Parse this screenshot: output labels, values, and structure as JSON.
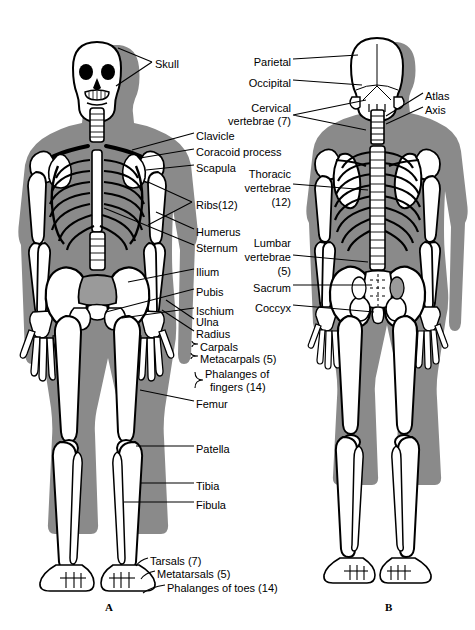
{
  "figure": {
    "background_color": "#ffffff",
    "body_silhouette_color": "#8a8a8a",
    "bone_color": "#ffffff",
    "outline_color": "#000000"
  },
  "panels": [
    {
      "id": "A",
      "label": "A",
      "view": "anterior",
      "x": 105,
      "y": 607
    },
    {
      "id": "B",
      "label": "B",
      "view": "posterior",
      "x": 385,
      "y": 607
    }
  ],
  "labels_left": [
    {
      "name": "skull",
      "text": "Skull",
      "x": 155,
      "y": 64
    },
    {
      "name": "clavicle",
      "text": "Clavicle",
      "x": 196,
      "y": 136
    },
    {
      "name": "coracoid-process",
      "text": "Coracoid process",
      "x": 196,
      "y": 152
    },
    {
      "name": "scapula",
      "text": "Scapula",
      "x": 196,
      "y": 168
    },
    {
      "name": "ribs",
      "text": "Ribs(12)",
      "x": 196,
      "y": 205
    },
    {
      "name": "humerus",
      "text": "Humerus",
      "x": 196,
      "y": 232
    },
    {
      "name": "sternum",
      "text": "Sternum",
      "x": 196,
      "y": 248
    },
    {
      "name": "ilium",
      "text": "Ilium",
      "x": 196,
      "y": 272
    },
    {
      "name": "pubis",
      "text": "Pubis",
      "x": 196,
      "y": 292
    },
    {
      "name": "ischium",
      "text": "Ischium",
      "x": 196,
      "y": 311
    },
    {
      "name": "ulna",
      "text": "Ulna",
      "x": 196,
      "y": 322
    },
    {
      "name": "radius",
      "text": "Radius",
      "x": 196,
      "y": 334
    },
    {
      "name": "carpals",
      "text": "Carpals",
      "x": 200,
      "y": 347
    },
    {
      "name": "metacarpals",
      "text": "Metacarpals (5)",
      "x": 200,
      "y": 359
    },
    {
      "name": "phalanges-fingers-1",
      "text": "Phalanges of",
      "x": 205,
      "y": 374
    },
    {
      "name": "phalanges-fingers-2",
      "text": "fingers (14)",
      "x": 210,
      "y": 387
    },
    {
      "name": "femur",
      "text": "Femur",
      "x": 196,
      "y": 404
    },
    {
      "name": "patella",
      "text": "Patella",
      "x": 196,
      "y": 449
    },
    {
      "name": "tibia",
      "text": "Tibia",
      "x": 196,
      "y": 486
    },
    {
      "name": "fibula",
      "text": "Fibula",
      "x": 196,
      "y": 505
    },
    {
      "name": "tarsals",
      "text": "Tarsals (7)",
      "x": 150,
      "y": 561
    },
    {
      "name": "metatarsals",
      "text": "Metatarsals (5)",
      "x": 157,
      "y": 574
    },
    {
      "name": "phalanges-toes",
      "text": "Phalanges of toes (14)",
      "x": 167,
      "y": 588
    }
  ],
  "labels_right": [
    {
      "name": "parietal",
      "text": "Parietal",
      "x": 291,
      "y": 62,
      "align": "right"
    },
    {
      "name": "occipital",
      "text": "Occipital",
      "x": 291,
      "y": 83,
      "align": "right"
    },
    {
      "name": "cervical-vertebrae-1",
      "text": "Cervical",
      "x": 291,
      "y": 108,
      "align": "right"
    },
    {
      "name": "cervical-vertebrae-2",
      "text": "vertebrae (7)",
      "x": 291,
      "y": 121,
      "align": "right"
    },
    {
      "name": "atlas",
      "text": "Atlas",
      "x": 425,
      "y": 96,
      "align": "left"
    },
    {
      "name": "axis",
      "text": "Axis",
      "x": 425,
      "y": 110,
      "align": "left"
    },
    {
      "name": "thoracic-vertebrae-1",
      "text": "Thoracic",
      "x": 291,
      "y": 174,
      "align": "right"
    },
    {
      "name": "thoracic-vertebrae-2",
      "text": "vertebrae",
      "x": 291,
      "y": 188,
      "align": "right"
    },
    {
      "name": "thoracic-vertebrae-3",
      "text": "(12)",
      "x": 291,
      "y": 202,
      "align": "right"
    },
    {
      "name": "lumbar-vertebrae-1",
      "text": "Lumbar",
      "x": 291,
      "y": 243,
      "align": "right"
    },
    {
      "name": "lumbar-vertebrae-2",
      "text": "vertebrae",
      "x": 291,
      "y": 257,
      "align": "right"
    },
    {
      "name": "lumbar-vertebrae-3",
      "text": "(5)",
      "x": 291,
      "y": 271,
      "align": "right"
    },
    {
      "name": "sacrum",
      "text": "Sacrum",
      "x": 291,
      "y": 288,
      "align": "right"
    },
    {
      "name": "coccyx",
      "text": "Coccyx",
      "x": 291,
      "y": 308,
      "align": "right"
    }
  ]
}
